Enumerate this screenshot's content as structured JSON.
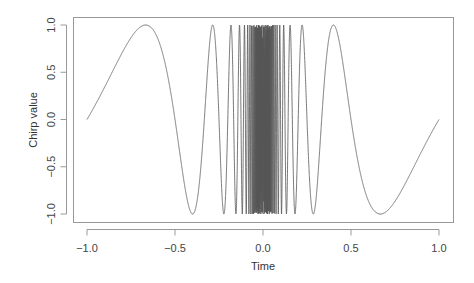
{
  "chart_data": {
    "type": "line",
    "title": "",
    "xlabel": "Time",
    "ylabel": "Chirp value",
    "function": "sin(pi / t)",
    "xlim": [
      -1.0,
      1.0
    ],
    "ylim": [
      -1.0,
      1.0
    ],
    "x_ticks": [
      -1.0,
      -0.5,
      0.0,
      0.5,
      1.0
    ],
    "x_tick_labels": [
      "−1.0",
      "−0.5",
      "0.0",
      "0.5",
      "1.0"
    ],
    "y_ticks": [
      -1.0,
      -0.5,
      0.0,
      0.5,
      1.0
    ],
    "y_tick_labels": [
      "−1.0",
      "−0.5",
      "0.0",
      "0.5",
      "1.0"
    ],
    "grid": false,
    "legend": null,
    "series": [
      {
        "name": "chirp",
        "color": "#555555",
        "x": [
          -1.0,
          -0.8,
          -0.6667,
          -0.5,
          -0.4,
          -0.3333,
          -0.2857,
          -0.25,
          -0.2222,
          -0.2,
          0.2,
          0.2222,
          0.25,
          0.2857,
          0.3333,
          0.4,
          0.5,
          0.6667,
          0.8,
          1.0
        ],
        "values": [
          0.0,
          0.7071,
          1.0,
          0.0,
          -1.0,
          0.0,
          1.0,
          0.0,
          -1.0,
          0.0,
          0.0,
          1.0,
          0.0,
          -1.0,
          0.0,
          1.0,
          0.0,
          -1.0,
          -0.7071,
          0.0
        ]
      }
    ],
    "notable_points": {
      "peaks": [
        -0.667,
        -0.286,
        0.4
      ],
      "troughs": [
        -0.4,
        0.667
      ]
    }
  },
  "plot": {
    "box": {
      "left": 73,
      "top": 17,
      "right": 453,
      "bottom": 222
    },
    "x_map": {
      "value_min": -1.0,
      "px_min": 87,
      "value_max": 1.0,
      "px_max": 439
    },
    "y_map": {
      "value_min": -1.0,
      "px_min": 214,
      "value_max": 1.0,
      "px_max": 25
    },
    "line_color": "#555555",
    "axis_color": "#999999"
  }
}
